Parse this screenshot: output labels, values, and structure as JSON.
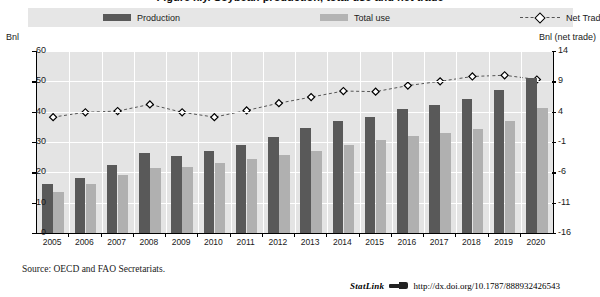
{
  "figure": {
    "title": "Figure x.y.  Soybean production, total use and net trade",
    "source": "Source:  OECD and FAO Secretariats.",
    "statlink": {
      "label": "StatLink",
      "icon": "statlink-arrow-icon",
      "url": "http://dx.doi.org/10.1787/888932426543"
    }
  },
  "legend": {
    "position": "top",
    "items": [
      {
        "label": "Production",
        "marker": "bar-swatch-dark",
        "color": "#595959"
      },
      {
        "label": "Total use",
        "marker": "bar-swatch-light",
        "color": "#b0b0b0"
      },
      {
        "label": "Net Trade",
        "marker": "diamond-marker-dashed-line",
        "color": "#555555"
      }
    ]
  },
  "chart_data": {
    "type": "bar",
    "title": "Soybean production, total use and net trade",
    "xlabel": "",
    "ylabel": "Bnl",
    "y2label": "Bnl (net trade)",
    "grid": true,
    "ylim": [
      0,
      60
    ],
    "yticks": [
      0,
      10,
      20,
      30,
      40,
      50,
      60
    ],
    "y2lim": [
      -16,
      14
    ],
    "y2ticks": [
      -16,
      -11,
      -6,
      -1,
      4,
      9,
      14
    ],
    "categories": [
      "2005",
      "2006",
      "2007",
      "2008",
      "2009",
      "2010",
      "2011",
      "2012",
      "2013",
      "2014",
      "2015",
      "2016",
      "2017",
      "2018",
      "2019",
      "2020"
    ],
    "series": [
      {
        "name": "Production",
        "type": "bar",
        "axis": "left",
        "color": "#595959",
        "values": [
          16.0,
          18.0,
          22.5,
          26.5,
          25.5,
          27.0,
          29.0,
          31.5,
          34.5,
          36.8,
          38.3,
          41.0,
          42.3,
          44.3,
          47.3,
          51.2
        ]
      },
      {
        "name": "Total use",
        "type": "bar",
        "axis": "left",
        "color": "#b0b0b0",
        "values": [
          13.5,
          16.3,
          19.0,
          21.5,
          21.8,
          23.0,
          24.3,
          25.8,
          27.2,
          29.0,
          30.8,
          32.0,
          33.0,
          34.3,
          37.0,
          41.3
        ]
      },
      {
        "name": "Net Trade",
        "type": "line",
        "axis": "right",
        "color": "#555555",
        "marker": "diamond",
        "values": [
          3.1,
          3.9,
          4.1,
          5.2,
          3.9,
          3.1,
          4.2,
          5.4,
          6.4,
          7.4,
          7.3,
          8.3,
          9.0,
          9.8,
          10.0,
          9.3
        ]
      }
    ]
  }
}
